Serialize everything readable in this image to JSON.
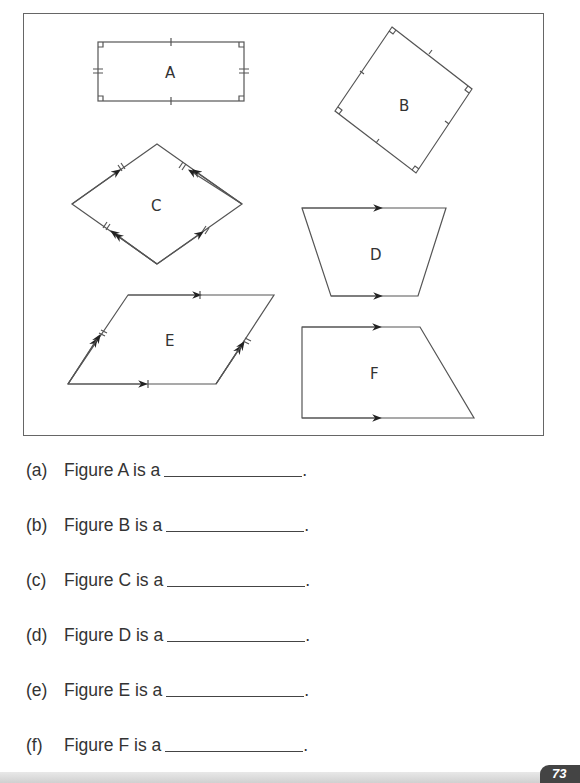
{
  "figures": {
    "A": {
      "label": "A"
    },
    "B": {
      "label": "B"
    },
    "C": {
      "label": "C"
    },
    "D": {
      "label": "D"
    },
    "E": {
      "label": "E"
    },
    "F": {
      "label": "F"
    }
  },
  "questions": [
    {
      "num": "(a)",
      "text": "Figure A is a",
      "end": "."
    },
    {
      "num": "(b)",
      "text": "Figure B is a",
      "end": "."
    },
    {
      "num": "(c)",
      "text": "Figure C is a",
      "end": "."
    },
    {
      "num": "(d)",
      "text": "Figure D is a",
      "end": "."
    },
    {
      "num": "(e)",
      "text": "Figure E is a",
      "end": "."
    },
    {
      "num": "(f)",
      "text": "Figure F is a",
      "end": "."
    }
  ],
  "footer": {
    "page_number": "73"
  },
  "colors": {
    "line": "#555555",
    "badge": "#444444"
  }
}
